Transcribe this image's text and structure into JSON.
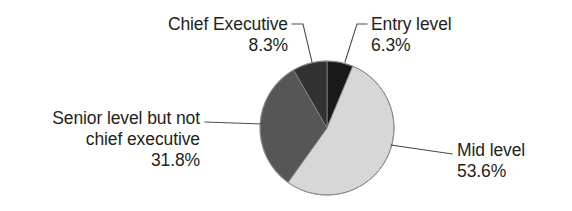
{
  "chart_data": {
    "type": "pie",
    "title": "",
    "subtitle": "",
    "xlabel": "",
    "ylabel": "",
    "legend_position": "none",
    "grid": false,
    "units": "percent",
    "start_angle_deg": 0,
    "direction": "clockwise",
    "categories": [
      "Entry level",
      "Mid level",
      "Senior level but not chief executive",
      "Chief Executive"
    ],
    "values": [
      6.3,
      53.6,
      31.8,
      8.3
    ],
    "slices": [
      {
        "name": "Entry level",
        "label_line1": "Entry level",
        "label_line2": "6.3%",
        "value": 6.3,
        "value_text": "6.3%",
        "color": "#1a1a1a",
        "start_deg": 0,
        "end_deg": 22.68
      },
      {
        "name": "Mid level",
        "label_line1": "Mid level",
        "label_line2": "53.6%",
        "value": 53.6,
        "value_text": "53.6%",
        "color": "#dcdcdc",
        "start_deg": 22.68,
        "end_deg": 215.64
      },
      {
        "name": "Senior level but not chief executive",
        "label_line1": "Senior level but not",
        "label_line2": "chief executive",
        "label_line3": "31.8%",
        "value": 31.8,
        "value_text": "31.8%",
        "color": "#585858",
        "start_deg": 215.64,
        "end_deg": 330.12
      },
      {
        "name": "Chief Executive",
        "label_line1": "Chief Executive",
        "label_line2": "8.3%",
        "value": 8.3,
        "value_text": "8.3%",
        "color": "#333333",
        "start_deg": 330.12,
        "end_deg": 360
      }
    ],
    "colors": {
      "entry_level": "#1a1a1a",
      "mid_level": "#dcdcdc",
      "senior_level": "#585858",
      "chief_executive": "#333333",
      "outline": "#8c8c8c",
      "leader_line": "#4d4d4d",
      "text": "#231f20",
      "background": "#ffffff"
    }
  }
}
